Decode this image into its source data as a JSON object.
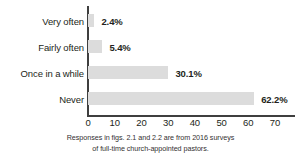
{
  "chart_data": {
    "type": "bar",
    "orientation": "horizontal",
    "title": "",
    "xlabel": "",
    "ylabel": "",
    "categories": [
      "Very often",
      "Fairly often",
      "Once in a while",
      "Never"
    ],
    "values": [
      2.4,
      5.4,
      30.1,
      62.2
    ],
    "value_labels": [
      "2.4%",
      "5.4%",
      "30.1%",
      "62.2%"
    ],
    "xticks": [
      "0",
      "10",
      "20",
      "30",
      "40",
      "50",
      "60",
      "70"
    ],
    "xtick_values": [
      0,
      10,
      20,
      30,
      40,
      50,
      60,
      70
    ],
    "xlim": [
      0,
      70
    ],
    "grid": false,
    "legend": false,
    "bar_color": "#dcdcdc",
    "axis_color": "#3f3f3f",
    "text_color": "#231f20"
  },
  "caption": {
    "line1": "Responses in figs. 2.1 and 2.2 are from 2016 surveys",
    "line2": "of full-time church-appointed pastors."
  }
}
